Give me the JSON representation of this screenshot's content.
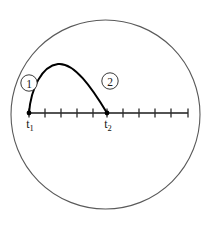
{
  "figure": {
    "background_color": "#ffffff",
    "boundary": {
      "shape": "circle",
      "center_x": 105.5,
      "center_y": 114.5,
      "radius": 94.5,
      "stroke_color": "#5a5a5a"
    }
  },
  "axis": {
    "name": "time-axis",
    "y": 113,
    "x_start": 29,
    "x_end": 188,
    "stroke_color": "#1a1a1a",
    "tick_height": 9,
    "tick_positions": [
      29,
      45,
      61,
      77,
      93,
      107,
      123,
      139,
      155,
      171,
      188
    ]
  },
  "curve": {
    "name": "trajectory-arc",
    "type": "parabola",
    "stroke_color": "#000000",
    "start": {
      "x": 29,
      "y": 113
    },
    "peak": {
      "x": 60,
      "y": 64
    },
    "end": {
      "x": 107,
      "y": 113
    },
    "path": "M 29,113 C 31,88 42,66 58,64 C 74,62 92,88 107,113"
  },
  "endpoints": [
    {
      "name": "t1-endpoint",
      "x": 29,
      "y": 113
    },
    {
      "name": "t2-endpoint",
      "x": 107,
      "y": 113
    }
  ],
  "markers": [
    {
      "name": "region-marker-1",
      "label": "1",
      "cx": 29,
      "cy": 83,
      "r": 8.2,
      "ring_color": "#3a3a3a"
    },
    {
      "name": "region-marker-2",
      "label": "2",
      "cx": 110,
      "cy": 81,
      "r": 8.2,
      "ring_color": "#3a3a3a"
    }
  ],
  "axis_labels": [
    {
      "name": "t1-label",
      "base": "t",
      "subscript": "1",
      "x": 30,
      "y": 128
    },
    {
      "name": "t2-label",
      "base": "t",
      "subscript": "2",
      "x": 108,
      "y": 128
    }
  ],
  "chart_data": {
    "type": "line",
    "title": "",
    "xlabel": "",
    "ylabel": "",
    "series": [
      {
        "name": "projectile-height",
        "x": [
          29,
          38,
          47,
          58,
          70,
          84,
          96,
          107
        ],
        "y": [
          113,
          86,
          71,
          64,
          68,
          85,
          100,
          113
        ]
      }
    ],
    "annotations": [
      "1",
      "2",
      "t1",
      "t2"
    ],
    "grid": false,
    "legend": "none"
  }
}
